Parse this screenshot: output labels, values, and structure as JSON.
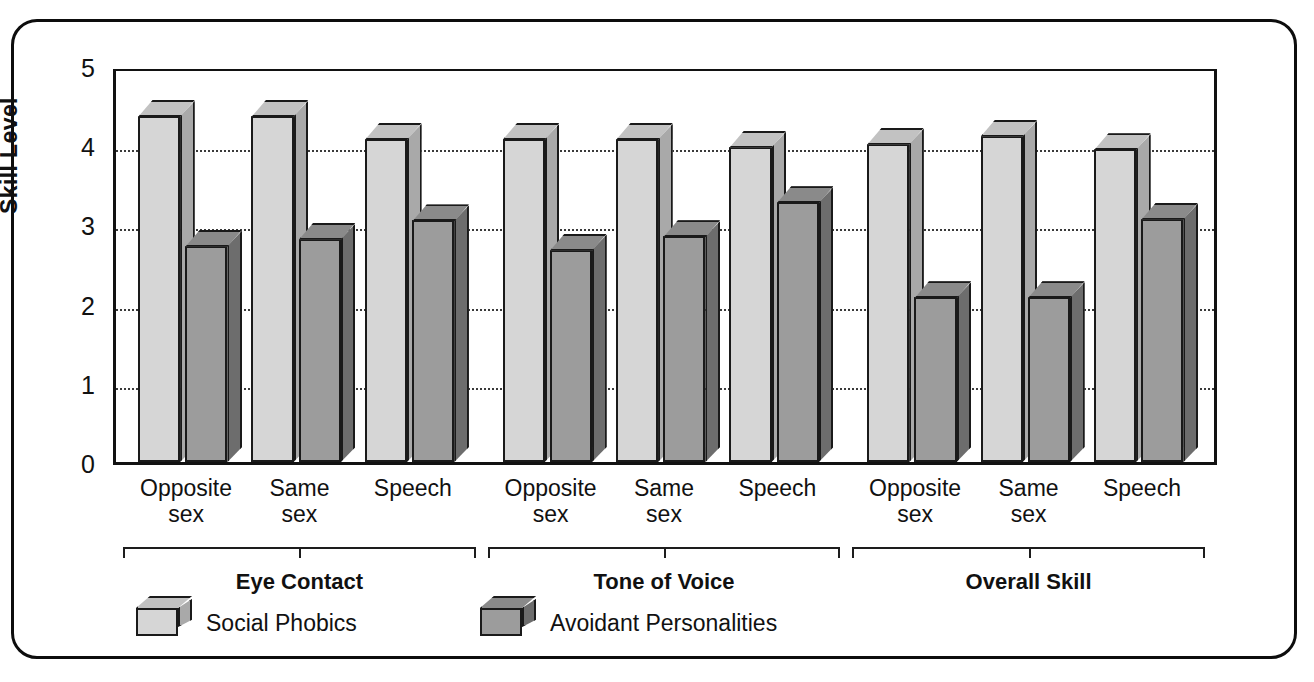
{
  "chart_data": {
    "type": "bar",
    "title": "",
    "xlabel": "",
    "ylabel": "Skill Level",
    "ylim": [
      0,
      5
    ],
    "ytick_labels": [
      "5",
      "4",
      "3",
      "2",
      "1",
      "0"
    ],
    "ytick_values": [
      5,
      4,
      3,
      2,
      1,
      0
    ],
    "grid": "horizontal dotted gridlines at 1, 2, 3, 4",
    "legend_position": "bottom-left",
    "categories": [
      "Opposite sex",
      "Same sex",
      "Speech",
      "Opposite sex",
      "Same sex",
      "Speech",
      "Opposite sex",
      "Same sex",
      "Speech"
    ],
    "groups": [
      {
        "label": "Eye Contact",
        "categories": [
          "Opposite sex",
          "Same sex",
          "Speech"
        ]
      },
      {
        "label": "Tone of Voice",
        "categories": [
          "Opposite sex",
          "Same sex",
          "Speech"
        ]
      },
      {
        "label": "Overall Skill",
        "categories": [
          "Opposite sex",
          "Same sex",
          "Speech"
        ]
      }
    ],
    "series": [
      {
        "name": "Social Phobics",
        "color": "#d6d6d6",
        "values": [
          4.37,
          4.37,
          4.08,
          4.08,
          4.08,
          3.98,
          4.02,
          4.12,
          3.95
        ]
      },
      {
        "name": "Avoidant Personalities",
        "color": "#9c9c9c",
        "values": [
          2.73,
          2.82,
          3.05,
          2.68,
          2.85,
          3.28,
          2.08,
          2.08,
          3.07
        ]
      }
    ]
  },
  "axis": {
    "y_label": "Skill Level",
    "ticks": [
      {
        "label": "5",
        "value": 5
      },
      {
        "label": "4",
        "value": 4
      },
      {
        "label": "3",
        "value": 3
      },
      {
        "label": "2",
        "value": 2
      },
      {
        "label": "1",
        "value": 1
      },
      {
        "label": "0",
        "value": 0
      }
    ]
  },
  "categories": [
    {
      "line1": "Opposite",
      "line2": "sex"
    },
    {
      "line1": "Same",
      "line2": "sex"
    },
    {
      "line1": "Speech",
      "line2": ""
    },
    {
      "line1": "Opposite",
      "line2": "sex"
    },
    {
      "line1": "Same",
      "line2": "sex"
    },
    {
      "line1": "Speech",
      "line2": ""
    },
    {
      "line1": "Opposite",
      "line2": "sex"
    },
    {
      "line1": "Same",
      "line2": "sex"
    },
    {
      "line1": "Speech",
      "line2": ""
    }
  ],
  "groups": [
    {
      "label": "Eye Contact"
    },
    {
      "label": "Tone of Voice"
    },
    {
      "label": "Overall Skill"
    }
  ],
  "legend": [
    {
      "label": "Social Phobics",
      "swatch": "light"
    },
    {
      "label": "Avoidant Personalities",
      "swatch": "dark"
    }
  ]
}
